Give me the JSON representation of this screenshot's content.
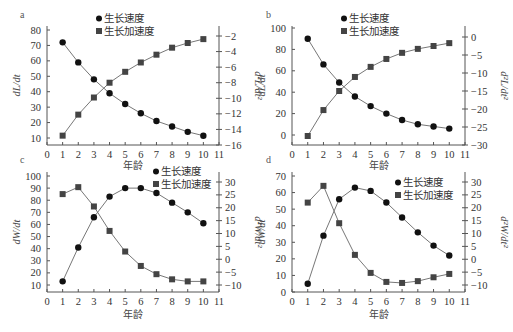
{
  "figure": {
    "legend": {
      "circle_label": "生长速度",
      "square_label": "生长加速度"
    },
    "xlabel": "年龄",
    "colors": {
      "axis": "#555555",
      "line": "#777777",
      "circle": "#111111",
      "square": "#444444"
    }
  },
  "chart_data": [
    {
      "panel": "a",
      "type": "line",
      "title": "",
      "xlabel": "年龄",
      "ylabel": "dL/dt",
      "y2label": "d²L/dt²",
      "x": [
        1,
        2,
        3,
        4,
        5,
        6,
        7,
        8,
        9,
        10
      ],
      "xticks": [
        0,
        1,
        2,
        3,
        4,
        5,
        6,
        7,
        8,
        9,
        10,
        11
      ],
      "xlim": [
        0,
        11
      ],
      "ylim": [
        5.5,
        80
      ],
      "yticks": [
        10,
        20,
        30,
        40,
        50,
        60,
        70,
        80
      ],
      "y2lim": [
        -16,
        -1
      ],
      "y2ticks": [
        -16,
        -14,
        -12,
        -10,
        -8,
        -6,
        -4,
        -2
      ],
      "legend_position": "top-center",
      "series": [
        {
          "name": "生长速度",
          "marker": "circle",
          "axis": "left",
          "values": [
            72,
            59,
            48,
            39,
            32,
            26,
            21,
            17.5,
            14,
            11.5
          ]
        },
        {
          "name": "生长加速度",
          "marker": "square",
          "axis": "right",
          "values": [
            -14.8,
            -12.1,
            -9.9,
            -8.0,
            -6.6,
            -5.4,
            -4.4,
            -3.5,
            -2.9,
            -2.4
          ]
        }
      ],
      "layout": {
        "x0": 47,
        "x1": 219,
        "top": 26,
        "bottom": 145,
        "yPix": [
          [
            80,
            30
          ],
          [
            10,
            138
          ]
        ],
        "y2Pix": [
          [
            -2,
            36
          ],
          [
            -16,
            145
          ]
        ],
        "letter": [
          20,
          18
        ],
        "legend": [
          96,
          22
        ],
        "xlabel_y": 169
      }
    },
    {
      "panel": "b",
      "type": "line",
      "title": "",
      "xlabel": "年龄",
      "ylabel": "dL/dt",
      "y2label": "d²L/dt²",
      "x": [
        1,
        2,
        3,
        4,
        5,
        6,
        7,
        8,
        9,
        10
      ],
      "xticks": [
        0,
        1,
        2,
        3,
        4,
        5,
        6,
        7,
        8,
        9,
        10,
        11
      ],
      "xlim": [
        0,
        11
      ],
      "ylim": [
        -10,
        100
      ],
      "yticks": [
        0,
        20,
        40,
        60,
        80,
        100
      ],
      "y2lim": [
        -30,
        2
      ],
      "y2ticks": [
        -30,
        -25,
        -20,
        -15,
        -10,
        -5,
        0
      ],
      "legend_position": "top-center",
      "series": [
        {
          "name": "生长速度",
          "marker": "circle",
          "axis": "left",
          "values": [
            90,
            66,
            49,
            36,
            27,
            20,
            14,
            10,
            8,
            6
          ]
        },
        {
          "name": "生长加速度",
          "marker": "square",
          "axis": "right",
          "values": [
            -27.5,
            -20.3,
            -15.0,
            -11.1,
            -8.3,
            -6.1,
            -4.4,
            -3.3,
            -2.5,
            -1.7
          ]
        }
      ],
      "layout": {
        "x0": 292,
        "x1": 465,
        "top": 26,
        "bottom": 145,
        "yPix": [
          [
            100,
            28
          ],
          [
            0,
            135
          ]
        ],
        "y2Pix": [
          [
            0,
            37
          ],
          [
            -30,
            145
          ]
        ],
        "letter": [
          266,
          18
        ],
        "legend": [
          341,
          22
        ],
        "xlabel_y": 169
      }
    },
    {
      "panel": "c",
      "type": "line",
      "title": "",
      "xlabel": "年龄",
      "ylabel": "dW/dt",
      "y2label": "d²W/dt²",
      "x": [
        1,
        2,
        3,
        4,
        5,
        6,
        7,
        8,
        9,
        10
      ],
      "xticks": [
        0,
        1,
        2,
        3,
        4,
        5,
        6,
        7,
        8,
        9,
        10,
        11
      ],
      "xlim": [
        0,
        11
      ],
      "ylim": [
        5,
        100
      ],
      "yticks": [
        10,
        20,
        30,
        40,
        50,
        60,
        70,
        80,
        90,
        100
      ],
      "y2lim": [
        -12,
        32
      ],
      "y2ticks": [
        -10,
        -5,
        0,
        5,
        10,
        15,
        20,
        25,
        30
      ],
      "legend_position": "top-right",
      "series": [
        {
          "name": "生长速度",
          "marker": "circle",
          "axis": "left",
          "values": [
            13,
            41,
            66,
            83,
            90,
            90,
            86,
            78,
            70,
            61
          ]
        },
        {
          "name": "生长加速度",
          "marker": "square",
          "axis": "right",
          "values": [
            25.3,
            28.0,
            20.5,
            11.0,
            3.0,
            -2.6,
            -5.8,
            -7.8,
            -8.6,
            -8.6
          ]
        }
      ],
      "layout": {
        "x0": 47,
        "x1": 219,
        "top": 172,
        "bottom": 292,
        "yPix": [
          [
            100,
            176
          ],
          [
            10,
            285
          ]
        ],
        "y2Pix": [
          [
            30,
            182
          ],
          [
            -10,
            285
          ]
        ],
        "letter": [
          20,
          163
        ],
        "legend": [
          153,
          175
        ],
        "xlabel_y": 318
      }
    },
    {
      "panel": "d",
      "type": "line",
      "title": "",
      "xlabel": "年龄",
      "ylabel": "dW/dt",
      "y2label": "d²W/dt²",
      "x": [
        1,
        2,
        3,
        4,
        5,
        6,
        7,
        8,
        9,
        10
      ],
      "xticks": [
        0,
        1,
        2,
        3,
        4,
        5,
        6,
        7,
        8,
        9,
        10,
        11
      ],
      "xlim": [
        0,
        11
      ],
      "ylim": [
        0,
        70
      ],
      "yticks": [
        0,
        10,
        20,
        30,
        40,
        50,
        60,
        70
      ],
      "y2lim": [
        -12,
        32
      ],
      "y2ticks": [
        -10,
        -5,
        0,
        5,
        10,
        15,
        20,
        25,
        30
      ],
      "legend_position": "top-right",
      "series": [
        {
          "name": "生长速度",
          "marker": "circle",
          "axis": "left",
          "values": [
            5,
            34,
            56,
            63,
            61,
            54,
            45,
            36,
            28,
            22
          ]
        },
        {
          "name": "生长加速度",
          "marker": "square",
          "axis": "right",
          "values": [
            22.0,
            28.5,
            14.0,
            1.7,
            -5.3,
            -8.8,
            -9.2,
            -8.5,
            -7.0,
            -5.7
          ]
        }
      ],
      "layout": {
        "x0": 292,
        "x1": 465,
        "top": 172,
        "bottom": 292,
        "yPix": [
          [
            70,
            176
          ],
          [
            0,
            292
          ]
        ],
        "y2Pix": [
          [
            30,
            182
          ],
          [
            -10,
            285
          ]
        ],
        "letter": [
          266,
          163
        ],
        "legend": [
          395,
          186
        ],
        "xlabel_y": 318
      }
    }
  ]
}
